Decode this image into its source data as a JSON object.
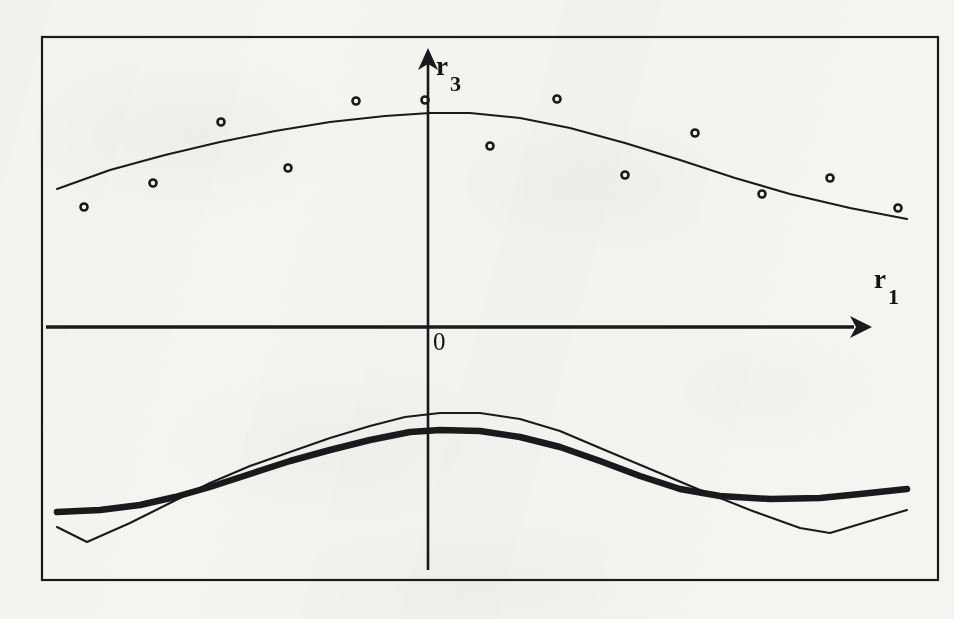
{
  "figure": {
    "background_color": "#f5f4f1",
    "ink_color": "#1a1a1a",
    "frame": {
      "x": 42,
      "y": 37,
      "width": 896,
      "height": 543,
      "stroke_width": 2.2
    },
    "axis_labels": {
      "x_base": "r",
      "x_sub": "1",
      "y_base": "r",
      "y_sub": "3",
      "origin": "0"
    }
  },
  "chart_data": {
    "type": "scatter",
    "title": "",
    "xlabel": "r1",
    "ylabel": "r3",
    "grid": false,
    "legend": null,
    "annotations": [
      {
        "text": "r",
        "sub": "1",
        "role": "x-axis-label",
        "x": 884,
        "y": 290
      },
      {
        "text": "r",
        "sub": "3",
        "role": "y-axis-label",
        "x": 443,
        "y": 72
      },
      {
        "text": "0",
        "role": "origin-label",
        "x": 434,
        "y": 346
      }
    ],
    "axes": {
      "origin_px": {
        "x": 428,
        "y": 327
      },
      "x_axis_px": {
        "x1": 46,
        "y1": 327,
        "x2": 858,
        "y2": 327,
        "arrow_tip_x": 872
      },
      "y_axis_px": {
        "x1": 428,
        "y1": 570,
        "x2": 428,
        "y2": 62,
        "arrow_tip_y": 48
      },
      "xlim_px": [
        42,
        938
      ],
      "ylim_px": [
        580,
        37
      ]
    },
    "series": [
      {
        "name": "observations",
        "type": "scatter",
        "marker": "open-circle",
        "marker_size_px": 7,
        "points_px": [
          {
            "x": 84,
            "y": 207
          },
          {
            "x": 153,
            "y": 183
          },
          {
            "x": 221,
            "y": 122
          },
          {
            "x": 288,
            "y": 168
          },
          {
            "x": 356,
            "y": 101
          },
          {
            "x": 425,
            "y": 100
          },
          {
            "x": 490,
            "y": 146
          },
          {
            "x": 557,
            "y": 99
          },
          {
            "x": 625,
            "y": 175
          },
          {
            "x": 695,
            "y": 133
          },
          {
            "x": 762,
            "y": 194
          },
          {
            "x": 830,
            "y": 178
          },
          {
            "x": 898,
            "y": 208
          }
        ]
      },
      {
        "name": "fitted-curve-upper",
        "type": "line",
        "line_style": "thin",
        "stroke_width_px": 2.1,
        "points_px": [
          {
            "x": 57,
            "y": 189
          },
          {
            "x": 110,
            "y": 170
          },
          {
            "x": 165,
            "y": 155
          },
          {
            "x": 220,
            "y": 142
          },
          {
            "x": 275,
            "y": 131
          },
          {
            "x": 330,
            "y": 122
          },
          {
            "x": 385,
            "y": 116
          },
          {
            "x": 430,
            "y": 113
          },
          {
            "x": 470,
            "y": 113
          },
          {
            "x": 520,
            "y": 118
          },
          {
            "x": 570,
            "y": 128
          },
          {
            "x": 625,
            "y": 143
          },
          {
            "x": 680,
            "y": 160
          },
          {
            "x": 735,
            "y": 178
          },
          {
            "x": 790,
            "y": 194
          },
          {
            "x": 850,
            "y": 208
          },
          {
            "x": 907,
            "y": 219
          }
        ]
      },
      {
        "name": "curve-thick-lower",
        "type": "line",
        "line_style": "thick",
        "stroke_width_px": 6.5,
        "points_px": [
          {
            "x": 57,
            "y": 512
          },
          {
            "x": 100,
            "y": 510
          },
          {
            "x": 140,
            "y": 505
          },
          {
            "x": 175,
            "y": 497
          },
          {
            "x": 210,
            "y": 487
          },
          {
            "x": 250,
            "y": 474
          },
          {
            "x": 290,
            "y": 461
          },
          {
            "x": 330,
            "y": 450
          },
          {
            "x": 370,
            "y": 440
          },
          {
            "x": 410,
            "y": 432
          },
          {
            "x": 440,
            "y": 430
          },
          {
            "x": 480,
            "y": 431
          },
          {
            "x": 520,
            "y": 437
          },
          {
            "x": 560,
            "y": 447
          },
          {
            "x": 600,
            "y": 461
          },
          {
            "x": 640,
            "y": 476
          },
          {
            "x": 680,
            "y": 489
          },
          {
            "x": 720,
            "y": 496
          },
          {
            "x": 770,
            "y": 499
          },
          {
            "x": 820,
            "y": 498
          },
          {
            "x": 860,
            "y": 494
          },
          {
            "x": 907,
            "y": 489
          }
        ]
      },
      {
        "name": "curve-thin-lower",
        "type": "line",
        "line_style": "thin",
        "stroke_width_px": 2.1,
        "points_px": [
          {
            "x": 57,
            "y": 527
          },
          {
            "x": 87,
            "y": 542
          },
          {
            "x": 130,
            "y": 523
          },
          {
            "x": 170,
            "y": 503
          },
          {
            "x": 210,
            "y": 483
          },
          {
            "x": 250,
            "y": 466
          },
          {
            "x": 290,
            "y": 452
          },
          {
            "x": 330,
            "y": 438
          },
          {
            "x": 370,
            "y": 426
          },
          {
            "x": 405,
            "y": 417
          },
          {
            "x": 440,
            "y": 413
          },
          {
            "x": 480,
            "y": 413
          },
          {
            "x": 520,
            "y": 419
          },
          {
            "x": 560,
            "y": 431
          },
          {
            "x": 600,
            "y": 448
          },
          {
            "x": 650,
            "y": 469
          },
          {
            "x": 700,
            "y": 490
          },
          {
            "x": 750,
            "y": 510
          },
          {
            "x": 800,
            "y": 528
          },
          {
            "x": 830,
            "y": 533
          },
          {
            "x": 870,
            "y": 521
          },
          {
            "x": 907,
            "y": 510
          }
        ]
      }
    ]
  }
}
